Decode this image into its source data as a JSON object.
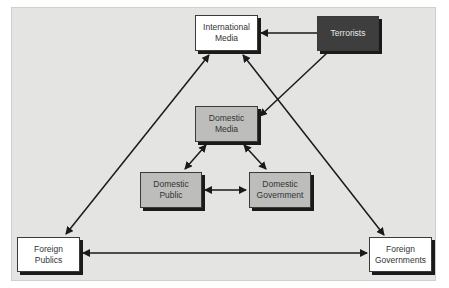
{
  "diagram": {
    "type": "flow",
    "background_color": "#e4e4e2",
    "nodes": [
      {
        "id": "international_media",
        "label": "International\nMedia",
        "style": "white"
      },
      {
        "id": "terrorists",
        "label": "Terrorists",
        "style": "dark"
      },
      {
        "id": "domestic_media",
        "label": "Domestic\nMedia",
        "style": "gray"
      },
      {
        "id": "domestic_public",
        "label": "Domestic\nPublic",
        "style": "gray"
      },
      {
        "id": "domestic_government",
        "label": "Domestic\nGovernment",
        "style": "gray"
      },
      {
        "id": "foreign_publics",
        "label": "Foreign\nPublics",
        "style": "white"
      },
      {
        "id": "foreign_governments",
        "label": "Foreign\nGovernments",
        "style": "white"
      }
    ],
    "edges": [
      {
        "from": "terrorists",
        "to": "international_media",
        "direction": "one-way"
      },
      {
        "from": "terrorists",
        "to": "domestic_media",
        "direction": "one-way"
      },
      {
        "from": "international_media",
        "to": "foreign_publics",
        "direction": "two-way"
      },
      {
        "from": "international_media",
        "to": "foreign_governments",
        "direction": "two-way"
      },
      {
        "from": "foreign_publics",
        "to": "foreign_governments",
        "direction": "two-way"
      },
      {
        "from": "domestic_media",
        "to": "domestic_public",
        "direction": "two-way"
      },
      {
        "from": "domestic_media",
        "to": "domestic_government",
        "direction": "two-way"
      },
      {
        "from": "domestic_public",
        "to": "domestic_government",
        "direction": "two-way"
      }
    ]
  }
}
